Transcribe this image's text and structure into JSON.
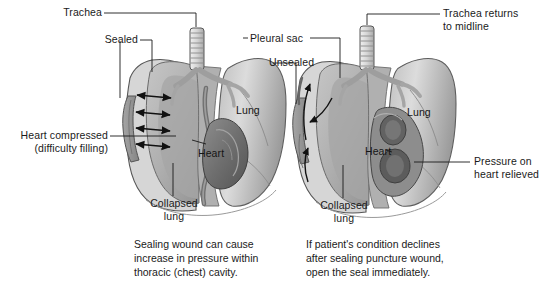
{
  "figure": {
    "background_color": "#ffffff",
    "line_color": "#1a1a1a",
    "text_color": "#1a1a1a",
    "width": 550,
    "height": 283
  },
  "palette": {
    "lung_light": "#d9d9d9",
    "lung_mid": "#b9b9b9",
    "lung_dark": "#9a9a9a",
    "pleura_outline": "#5a5a5a",
    "heart_dark": "#6e6e6e",
    "heart_mid": "#8a8a8a",
    "trachea": "#e2e2e2",
    "wound": "#8f8f8f",
    "stroke": "#4a4a4a"
  },
  "left_panel": {
    "name": "sealed-wound-panel",
    "labels": {
      "trachea": "Trachea",
      "sealed": "Sealed",
      "heart_compressed_line1": "Heart compressed",
      "heart_compressed_line2": "(difficulty filling)",
      "lung": "Lung",
      "heart": "Heart",
      "collapsed_lung_line1": "Collapsed",
      "collapsed_lung_line2": "lung"
    },
    "pressure_arrows": {
      "name": "pressure-arrows",
      "count": 4,
      "style": "double-headed",
      "meaning": "increasing intrathoracic pressure pushing toward midline"
    },
    "caption_line1": "Sealing wound can cause",
    "caption_line2": "increase in pressure within",
    "caption_line3": "thoracic (chest) cavity."
  },
  "right_panel": {
    "name": "unsealed-wound-panel",
    "labels": {
      "pleural_sac": "Pleural sac",
      "unsealed": "Unsealed",
      "trachea_returns_line1": "Trachea returns",
      "trachea_returns_line2": "to midline",
      "lung": "Lung",
      "heart": "Heart",
      "pressure_relieved_line1": "Pressure on",
      "pressure_relieved_line2": "heart relieved",
      "collapsed_lung_line1": "Collapsed",
      "collapsed_lung_line2": "lung"
    },
    "flow_arrows": {
      "name": "air-flow-arrows",
      "count": 3,
      "style": "curved",
      "meaning": "air escaping and entering through the open seal"
    },
    "caption_line1": "If patient's condition declines",
    "caption_line2": "after sealing puncture wound,",
    "caption_line3": "open the seal immediately."
  }
}
